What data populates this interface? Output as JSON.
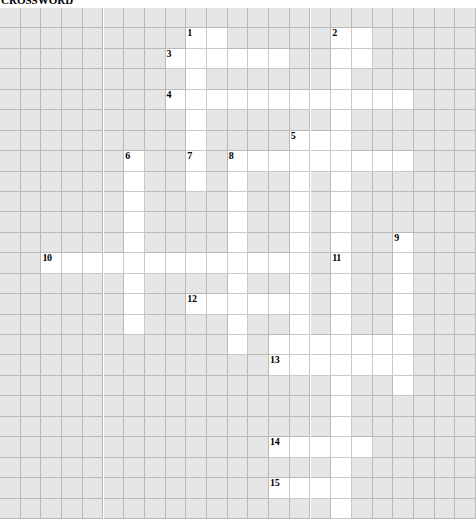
{
  "page": {
    "clipped_header_text": "CROSSWORD"
  },
  "grid": {
    "columns": 23,
    "rows": 25,
    "cell_width": 20.7,
    "cell_height": 20.44,
    "origin_x": 0,
    "origin_y": 8,
    "colors": {
      "block": "#e6e6e6",
      "open": "#ffffff",
      "gridline": "#b9b9b9",
      "number": "#000000",
      "page_background": "#ffffff"
    }
  },
  "numbered_clues": [
    {
      "number": "1",
      "row": 1,
      "col": 9,
      "directions": [
        "down"
      ]
    },
    {
      "number": "2",
      "row": 1,
      "col": 16,
      "directions": [
        "down"
      ]
    },
    {
      "number": "3",
      "row": 2,
      "col": 8,
      "directions": [
        "across"
      ]
    },
    {
      "number": "4",
      "row": 4,
      "col": 8,
      "directions": [
        "across"
      ]
    },
    {
      "number": "5",
      "row": 6,
      "col": 14,
      "directions": [
        "down"
      ]
    },
    {
      "number": "6",
      "row": 7,
      "col": 6,
      "directions": [
        "down"
      ]
    },
    {
      "number": "7",
      "row": 7,
      "col": 9,
      "directions": [
        "across",
        "down"
      ]
    },
    {
      "number": "8",
      "row": 7,
      "col": 11,
      "directions": [
        "across",
        "down"
      ]
    },
    {
      "number": "9",
      "row": 11,
      "col": 19,
      "directions": [
        "down"
      ]
    },
    {
      "number": "10",
      "row": 12,
      "col": 2,
      "directions": [
        "across"
      ]
    },
    {
      "number": "11",
      "row": 12,
      "col": 16,
      "directions": [
        "down"
      ]
    },
    {
      "number": "12",
      "row": 14,
      "col": 9,
      "directions": [
        "across"
      ]
    },
    {
      "number": "13",
      "row": 17,
      "col": 13,
      "directions": [
        "across",
        "down"
      ]
    },
    {
      "number": "14",
      "row": 21,
      "col": 13,
      "directions": [
        "across"
      ]
    },
    {
      "number": "15",
      "row": 23,
      "col": 13,
      "directions": [
        "across"
      ]
    }
  ],
  "open_cells": [
    [
      1,
      9
    ],
    [
      1,
      10
    ],
    [
      1,
      16
    ],
    [
      1,
      17
    ],
    [
      2,
      8
    ],
    [
      2,
      9
    ],
    [
      2,
      10
    ],
    [
      2,
      11
    ],
    [
      2,
      12
    ],
    [
      2,
      13
    ],
    [
      2,
      16
    ],
    [
      2,
      17
    ],
    [
      3,
      9
    ],
    [
      3,
      16
    ],
    [
      4,
      8
    ],
    [
      4,
      9
    ],
    [
      4,
      10
    ],
    [
      4,
      11
    ],
    [
      4,
      12
    ],
    [
      4,
      13
    ],
    [
      4,
      14
    ],
    [
      4,
      15
    ],
    [
      4,
      16
    ],
    [
      4,
      17
    ],
    [
      4,
      18
    ],
    [
      4,
      19
    ],
    [
      5,
      9
    ],
    [
      5,
      16
    ],
    [
      6,
      9
    ],
    [
      6,
      14
    ],
    [
      6,
      15
    ],
    [
      6,
      16
    ],
    [
      7,
      6
    ],
    [
      7,
      9
    ],
    [
      7,
      11
    ],
    [
      7,
      12
    ],
    [
      7,
      13
    ],
    [
      7,
      14
    ],
    [
      7,
      15
    ],
    [
      7,
      16
    ],
    [
      7,
      17
    ],
    [
      7,
      18
    ],
    [
      7,
      19
    ],
    [
      8,
      6
    ],
    [
      8,
      9
    ],
    [
      8,
      11
    ],
    [
      8,
      14
    ],
    [
      8,
      16
    ],
    [
      9,
      6
    ],
    [
      9,
      11
    ],
    [
      9,
      14
    ],
    [
      9,
      16
    ],
    [
      10,
      6
    ],
    [
      10,
      11
    ],
    [
      10,
      14
    ],
    [
      10,
      16
    ],
    [
      11,
      6
    ],
    [
      11,
      11
    ],
    [
      11,
      14
    ],
    [
      11,
      16
    ],
    [
      11,
      19
    ],
    [
      12,
      2
    ],
    [
      12,
      3
    ],
    [
      12,
      4
    ],
    [
      12,
      5
    ],
    [
      12,
      6
    ],
    [
      12,
      7
    ],
    [
      12,
      8
    ],
    [
      12,
      9
    ],
    [
      12,
      10
    ],
    [
      12,
      11
    ],
    [
      12,
      12
    ],
    [
      12,
      13
    ],
    [
      12,
      14
    ],
    [
      12,
      16
    ],
    [
      12,
      19
    ],
    [
      13,
      6
    ],
    [
      13,
      11
    ],
    [
      13,
      14
    ],
    [
      13,
      16
    ],
    [
      13,
      19
    ],
    [
      14,
      6
    ],
    [
      14,
      9
    ],
    [
      14,
      10
    ],
    [
      14,
      11
    ],
    [
      14,
      12
    ],
    [
      14,
      13
    ],
    [
      14,
      14
    ],
    [
      14,
      16
    ],
    [
      14,
      19
    ],
    [
      15,
      6
    ],
    [
      15,
      11
    ],
    [
      15,
      14
    ],
    [
      15,
      16
    ],
    [
      15,
      19
    ],
    [
      16,
      11
    ],
    [
      16,
      13
    ],
    [
      16,
      14
    ],
    [
      16,
      15
    ],
    [
      16,
      16
    ],
    [
      16,
      17
    ],
    [
      16,
      18
    ],
    [
      16,
      19
    ],
    [
      17,
      13
    ],
    [
      17,
      14
    ],
    [
      17,
      15
    ],
    [
      17,
      16
    ],
    [
      17,
      17
    ],
    [
      17,
      18
    ],
    [
      17,
      19
    ],
    [
      18,
      16
    ],
    [
      18,
      19
    ],
    [
      19,
      16
    ],
    [
      20,
      16
    ],
    [
      21,
      13
    ],
    [
      21,
      14
    ],
    [
      21,
      15
    ],
    [
      21,
      16
    ],
    [
      21,
      17
    ],
    [
      22,
      16
    ],
    [
      23,
      13
    ],
    [
      23,
      14
    ],
    [
      23,
      15
    ],
    [
      23,
      16
    ],
    [
      24,
      16
    ]
  ]
}
